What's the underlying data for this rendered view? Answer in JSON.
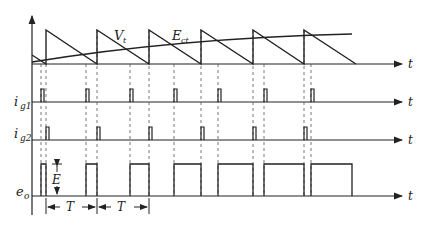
{
  "diagram": {
    "type": "timing-waveform",
    "labels": {
      "vt": "V",
      "vt_sub": "t",
      "ect": "E",
      "ect_sub": "ct",
      "ig1": "i",
      "ig1_sub": "g1",
      "ig2": "i",
      "ig2_sub": "g2",
      "eo": "e",
      "eo_sub": "o",
      "amplitude": "E",
      "period1": "T",
      "period2": "T",
      "t_axis": "t"
    },
    "colors": {
      "stroke": "#222222",
      "dash": "#555555"
    }
  }
}
